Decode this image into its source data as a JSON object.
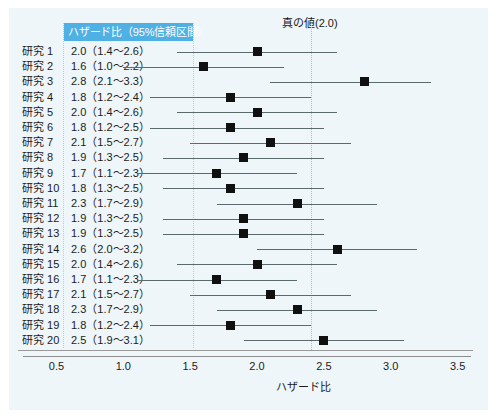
{
  "table": {
    "header_label": "ハザード比（95%信頼区間）",
    "columns": [
      "",
      "ハザード比（95%信頼区間）"
    ],
    "rows": [
      {
        "study": "研究 1",
        "text": "2.0（1.4〜2.6）",
        "hr": 2.0,
        "low": 1.4,
        "high": 2.6
      },
      {
        "study": "研究 2",
        "text": "1.6（1.0〜2.2）",
        "hr": 1.6,
        "low": 1.0,
        "high": 2.2
      },
      {
        "study": "研究 3",
        "text": "2.8（2.1〜3.3）",
        "hr": 2.8,
        "low": 2.1,
        "high": 3.3
      },
      {
        "study": "研究 4",
        "text": "1.8（1.2〜2.4）",
        "hr": 1.8,
        "low": 1.2,
        "high": 2.4
      },
      {
        "study": "研究 5",
        "text": "2.0（1.4〜2.6）",
        "hr": 2.0,
        "low": 1.4,
        "high": 2.6
      },
      {
        "study": "研究 6",
        "text": "1.8（1.2〜2.5）",
        "hr": 1.8,
        "low": 1.2,
        "high": 2.5
      },
      {
        "study": "研究 7",
        "text": "2.1（1.5〜2.7）",
        "hr": 2.1,
        "low": 1.5,
        "high": 2.7
      },
      {
        "study": "研究 8",
        "text": "1.9（1.3〜2.5）",
        "hr": 1.9,
        "low": 1.3,
        "high": 2.5
      },
      {
        "study": "研究 9",
        "text": "1.7（1.1〜2.3）",
        "hr": 1.7,
        "low": 1.1,
        "high": 2.3
      },
      {
        "study": "研究 10",
        "text": "1.8（1.3〜2.5）",
        "hr": 1.8,
        "low": 1.3,
        "high": 2.5
      },
      {
        "study": "研究 11",
        "text": "2.3（1.7〜2.9）",
        "hr": 2.3,
        "low": 1.7,
        "high": 2.9
      },
      {
        "study": "研究 12",
        "text": "1.9（1.3〜2.5）",
        "hr": 1.9,
        "low": 1.3,
        "high": 2.5
      },
      {
        "study": "研究 13",
        "text": "1.9（1.3〜2.5）",
        "hr": 1.9,
        "low": 1.3,
        "high": 2.5
      },
      {
        "study": "研究 14",
        "text": "2.6（2.0〜3.2）",
        "hr": 2.6,
        "low": 2.0,
        "high": 3.2
      },
      {
        "study": "研究 15",
        "text": "2.0（1.4〜2.6）",
        "hr": 2.0,
        "low": 1.4,
        "high": 2.6
      },
      {
        "study": "研究 16",
        "text": "1.7（1.1〜2.3）",
        "hr": 1.7,
        "low": 1.1,
        "high": 2.3
      },
      {
        "study": "研究 17",
        "text": "2.1（1.5〜2.7）",
        "hr": 2.1,
        "low": 1.5,
        "high": 2.7
      },
      {
        "study": "研究 18",
        "text": "2.3（1.7〜2.9）",
        "hr": 2.3,
        "low": 1.7,
        "high": 2.9
      },
      {
        "study": "研究 19",
        "text": "1.8（1.2〜2.4）",
        "hr": 1.8,
        "low": 1.2,
        "high": 2.4
      },
      {
        "study": "研究 20",
        "text": "2.5（1.9〜3.1）",
        "hr": 2.5,
        "low": 1.9,
        "high": 3.1
      }
    ]
  },
  "chart_data": {
    "type": "scatter",
    "title": "真の値(2.0)",
    "xlabel": "ハザード比",
    "ylabel": "",
    "xlim": [
      0.25,
      3.6
    ],
    "xticks": [
      0.5,
      1.0,
      1.5,
      2.0,
      2.5,
      3.0,
      3.5
    ],
    "xtick_labels": [
      "0.5",
      "1.0",
      "1.5",
      "2.0",
      "2.5",
      "3.0",
      "3.5"
    ],
    "grid": false,
    "legend": null,
    "reference_line": {
      "value": 2.0,
      "label": "真の値(2.0)",
      "style": "dotted",
      "color": "#b9b9b9"
    },
    "marker_color": "#101010",
    "ci_color": "#5a6b6b",
    "categories": [
      "研究 1",
      "研究 2",
      "研究 3",
      "研究 4",
      "研究 5",
      "研究 6",
      "研究 7",
      "研究 8",
      "研究 9",
      "研究 10",
      "研究 11",
      "研究 12",
      "研究 13",
      "研究 14",
      "研究 15",
      "研究 16",
      "研究 17",
      "研究 18",
      "研究 19",
      "研究 20"
    ],
    "values": [
      2.0,
      1.6,
      2.8,
      1.8,
      2.0,
      1.8,
      2.1,
      1.9,
      1.7,
      1.8,
      2.3,
      1.9,
      1.9,
      2.6,
      2.0,
      1.7,
      2.1,
      2.3,
      1.8,
      2.5
    ],
    "ci_low": [
      1.4,
      1.0,
      2.1,
      1.2,
      1.4,
      1.2,
      1.5,
      1.3,
      1.1,
      1.3,
      1.7,
      1.3,
      1.3,
      2.0,
      1.4,
      1.1,
      1.5,
      1.7,
      1.2,
      1.9
    ],
    "ci_high": [
      2.6,
      2.2,
      3.3,
      2.4,
      2.6,
      2.5,
      2.7,
      2.5,
      2.3,
      2.5,
      2.9,
      2.5,
      2.5,
      3.2,
      2.6,
      2.3,
      2.7,
      2.9,
      2.4,
      3.1
    ]
  },
  "colors": {
    "header_bar": "#4fb0e4",
    "header_text": "#ffffff",
    "plate": "#eef6fa",
    "separator": "#9fd4ea",
    "axis": "#8c8c8c"
  }
}
